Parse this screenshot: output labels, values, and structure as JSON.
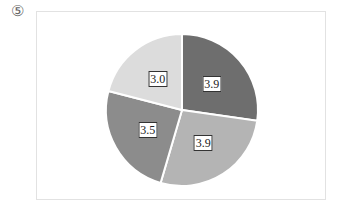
{
  "figure": {
    "marker": "⑤"
  },
  "chart_data": {
    "type": "pie",
    "title": "",
    "start_angle_deg": 0,
    "direction": "clockwise",
    "categories": [
      "Slice 1",
      "Slice 2",
      "Slice 3",
      "Slice 4"
    ],
    "values": [
      3.9,
      3.9,
      3.5,
      3.0
    ],
    "labels": [
      "3.9",
      "3.9",
      "3.5",
      "3.0"
    ],
    "colors": [
      "#6e6e6e",
      "#b4b4b4",
      "#8c8c8c",
      "#dcdcdc"
    ],
    "legend": "none",
    "data_labels": true
  }
}
